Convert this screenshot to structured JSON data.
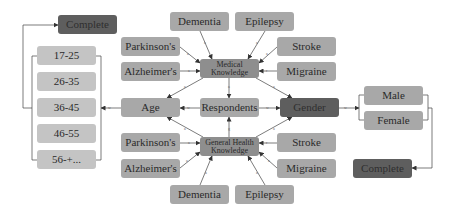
{
  "diagram": {
    "center": "Respondents",
    "hubs": {
      "medical": "Medical Knowledge",
      "general": "General Health Knowledge",
      "age": "Age",
      "gender": "Gender"
    },
    "medical_conditions": {
      "dementia": "Dementia",
      "epilepsy": "Epilepsy",
      "parkinsons": "Parkinson's",
      "alzheimers": "Alzheimer's",
      "stroke": "Stroke",
      "migraine": "Migraine"
    },
    "general_conditions": {
      "dementia": "Dementia",
      "epilepsy": "Epilepsy",
      "parkinsons": "Parkinson's",
      "alzheimers": "Alzheimer's",
      "stroke": "Stroke",
      "migraine": "Migraine"
    },
    "age_groups": [
      "17-25",
      "26-35",
      "36-45",
      "46-55",
      "56-+..."
    ],
    "genders": [
      "Male",
      "Female"
    ],
    "complete_left": "Complete",
    "complete_right": "Complete",
    "colors": {
      "light_node": "#c4c4c4",
      "mid_node": "#a8a8a8",
      "knowledge_node": "#8e8e8e",
      "dark_node": "#5e5e5e",
      "edge": "#444444"
    }
  }
}
